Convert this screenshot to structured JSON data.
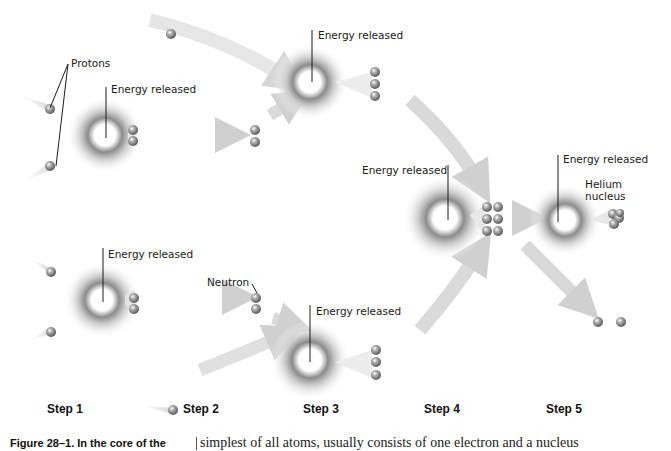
{
  "labels": {
    "protons": "Protons",
    "energy": "Energy released",
    "neutron": "Neutron",
    "helium_line1": "Helium",
    "helium_line2": "nucleus"
  },
  "steps": [
    "Step 1",
    "Step 2",
    "Step 3",
    "Step 4",
    "Step 5"
  ],
  "caption": {
    "figure": "Figure 28–1. In the core of the",
    "body_text": "simplest of all atoms, usually consists of one electron and a nucleus"
  },
  "colors": {
    "arrow": "#d4d4d4",
    "particle": "#8a8a8a",
    "text": "#1a1a1a"
  }
}
